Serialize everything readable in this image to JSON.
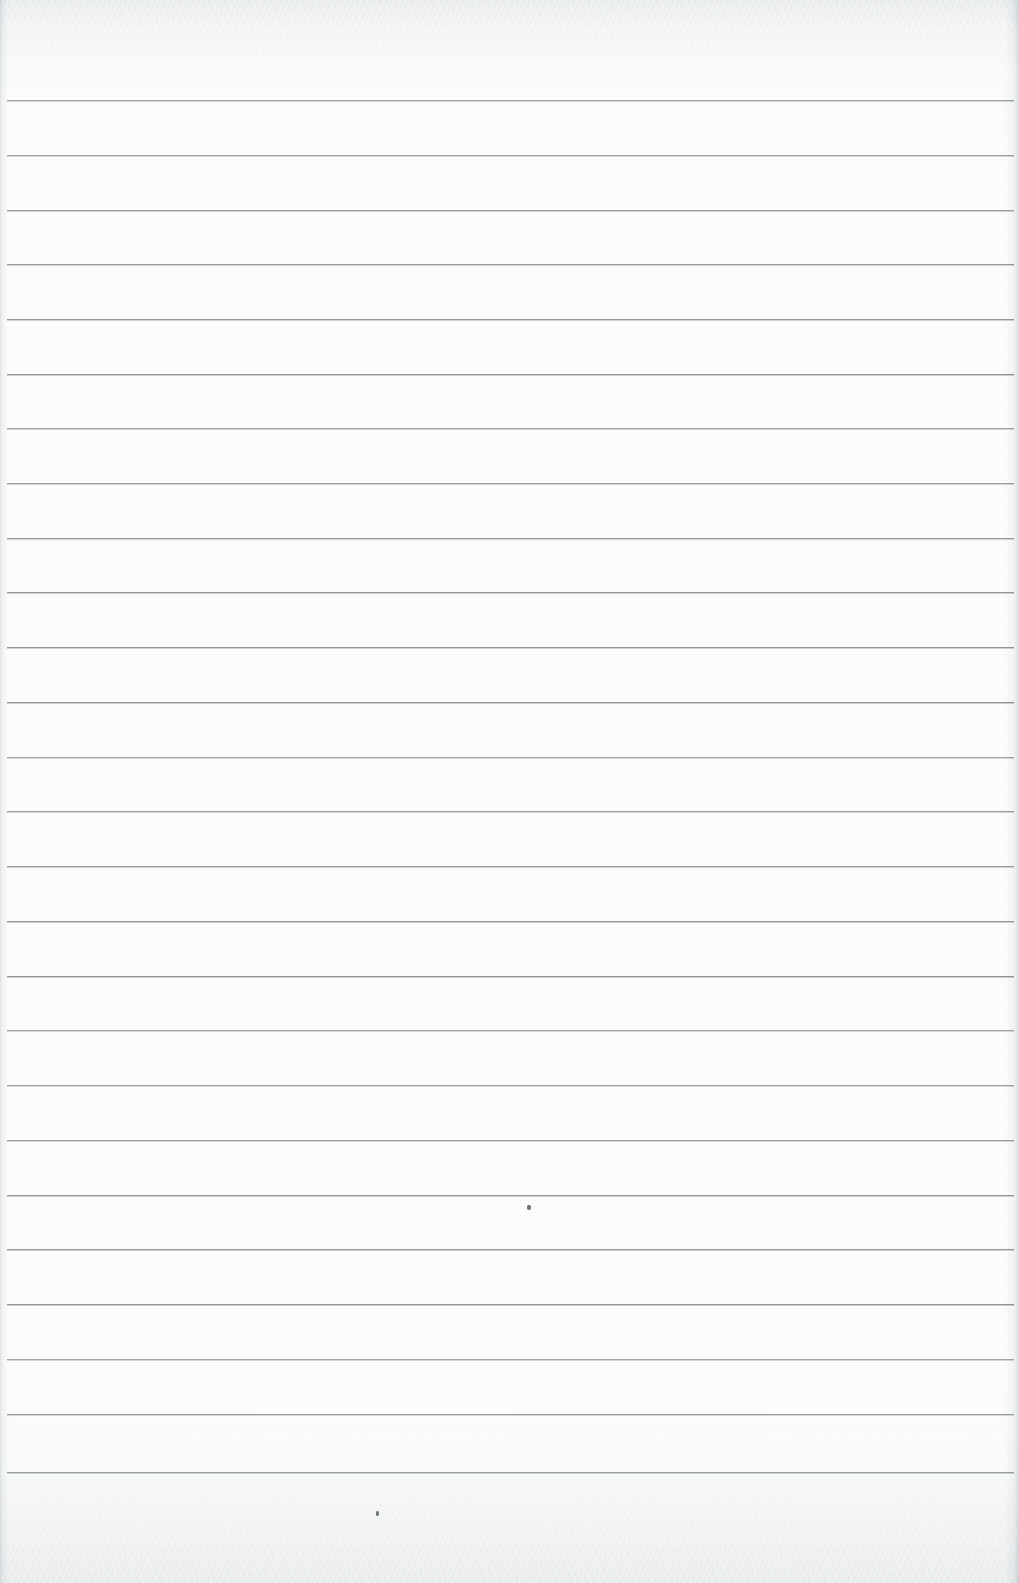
{
  "document": {
    "kind": "scanned-lined-notebook-page",
    "title": "Blank ruled notebook page",
    "page_width": 1019,
    "page_height": 1583,
    "written_text": "",
    "text_content_present": false
  },
  "paper": {
    "background_color": "#fdfdfd",
    "edge_tint_color": "#eef0f1",
    "texture": "faint horizontal scanner grain, strongest at top and bottom margins"
  },
  "ruling": {
    "line_color": "#8d9295",
    "line_thickness_px": 1,
    "line_count": 26,
    "first_line_y": 100,
    "line_spacing_px": 54.9,
    "line_start_x": 7,
    "line_end_x": 1014,
    "top_margin_px": 100,
    "bottom_margin_px": 111,
    "lines_y": [
      100,
      155,
      210,
      264,
      319,
      374,
      428,
      483,
      538,
      592,
      647,
      702,
      757,
      811,
      866,
      921,
      976,
      1030,
      1085,
      1140,
      1195,
      1249,
      1304,
      1359,
      1414,
      1472
    ]
  },
  "edges": {
    "left_shadow_width_px": 9,
    "right_shadow_width_px": 14,
    "shadow_color": "#a8aeb2"
  },
  "artifacts": {
    "specks": [
      {
        "label": "speck-mid-page",
        "x": 527,
        "y": 1205,
        "width": 4,
        "height": 5
      },
      {
        "label": "speck-lower-margin",
        "x": 376,
        "y": 1511,
        "width": 3,
        "height": 5
      }
    ]
  }
}
